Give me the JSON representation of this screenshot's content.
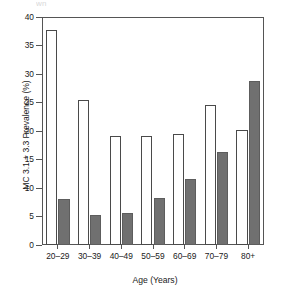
{
  "figure": {
    "top_remnant_left": "wn",
    "top_remnant_right": "",
    "background": "#ffffff"
  },
  "axes": {
    "y_title": "MC 3.1 + 3.3 Prevalence (%)",
    "x_title": "Age (Years)",
    "y_ticks": [
      "0",
      "5",
      "10",
      "15",
      "20",
      "25",
      "30",
      "35",
      "40"
    ],
    "x_ticks": [
      "20–29",
      "30–39",
      "40–49",
      "50–59",
      "60–69",
      "70–79",
      "80+"
    ]
  },
  "colors": {
    "series_open_fill": "#ffffff",
    "series_open_stroke": "#4a4a4a",
    "series_filled_fill": "#707070",
    "series_filled_stroke": "#5d5d5d",
    "axis": "#555555",
    "text": "#1a1a1a"
  },
  "chart_data": {
    "type": "bar",
    "title": "",
    "subtitle": "",
    "xlabel": "Age (Years)",
    "ylabel": "MC 3.1 + 3.3 Prevalence (%)",
    "categories": [
      "20–29",
      "30–39",
      "40–49",
      "50–59",
      "60–69",
      "70–79",
      "80+"
    ],
    "series": [
      {
        "name": "open",
        "fill": "#ffffff",
        "values": [
          37.8,
          25.4,
          19.2,
          19.2,
          19.5,
          24.5,
          20.2
        ]
      },
      {
        "name": "filled",
        "fill": "#707070",
        "values": [
          8.0,
          5.3,
          5.7,
          8.3,
          11.5,
          16.3,
          28.7
        ]
      }
    ],
    "ylim": [
      0,
      40
    ],
    "ytick_values": [
      0,
      5,
      10,
      15,
      20,
      25,
      30,
      35,
      40
    ],
    "ytick_step": 5,
    "grid": false,
    "legend": "none",
    "legend_position": "none",
    "frame": "full-box",
    "annotations": []
  }
}
